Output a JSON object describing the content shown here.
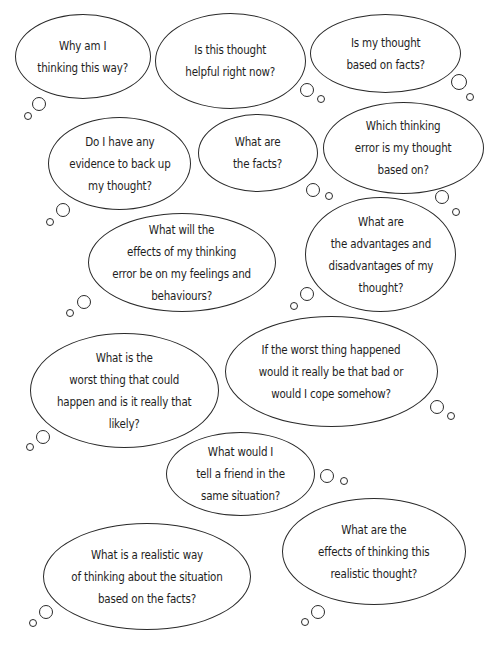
{
  "page": {
    "background": "#ffffff",
    "stroke_color": "#2a2a2a",
    "text_color": "#1e1e1e"
  },
  "bubbles": [
    {
      "id": "why-am-i-thinking",
      "lines": [
        "Why am I",
        "thinking this way?"
      ],
      "box": {
        "x": 15,
        "y": 14,
        "w": 136,
        "h": 85
      },
      "tails": [
        {
          "x": 39,
          "y": 104,
          "r": 7
        },
        {
          "x": 28,
          "y": 116,
          "r": 4
        }
      ]
    },
    {
      "id": "is-this-thought-helpful",
      "lines": [
        "Is this thought",
        "helpful right now?"
      ],
      "box": {
        "x": 155,
        "y": 13,
        "w": 151,
        "h": 96
      },
      "tails": [
        {
          "x": 307,
          "y": 90,
          "r": 7
        },
        {
          "x": 321,
          "y": 99,
          "r": 4
        }
      ]
    },
    {
      "id": "is-my-thought-based-on-facts",
      "lines": [
        "Is my thought",
        "based on facts?"
      ],
      "box": {
        "x": 310,
        "y": 14,
        "w": 151,
        "h": 79
      },
      "tails": [
        {
          "x": 459,
          "y": 82,
          "r": 8
        },
        {
          "x": 470,
          "y": 97,
          "r": 4
        }
      ]
    },
    {
      "id": "evidence-to-back-up",
      "lines": [
        "Do I have any",
        "evidence to back up",
        "my thought?"
      ],
      "box": {
        "x": 48,
        "y": 117,
        "w": 143,
        "h": 93
      },
      "tails": [
        {
          "x": 63,
          "y": 210,
          "r": 7
        },
        {
          "x": 50,
          "y": 222,
          "r": 4
        }
      ]
    },
    {
      "id": "what-are-the-facts",
      "lines": [
        "What are",
        "the facts?"
      ],
      "box": {
        "x": 198,
        "y": 114,
        "w": 120,
        "h": 78
      },
      "tails": [
        {
          "x": 313,
          "y": 190,
          "r": 7
        },
        {
          "x": 329,
          "y": 196,
          "r": 4
        }
      ]
    },
    {
      "id": "which-thinking-error",
      "lines": [
        "Which thinking",
        "error is my thought",
        "based on?"
      ],
      "box": {
        "x": 323,
        "y": 102,
        "w": 161,
        "h": 92
      },
      "tails": [
        {
          "x": 442,
          "y": 197,
          "r": 7
        },
        {
          "x": 456,
          "y": 212,
          "r": 4
        }
      ]
    },
    {
      "id": "effects-of-thinking-error",
      "lines": [
        "What will the",
        "effects of my thinking",
        "error be on my feelings and",
        "behaviours?"
      ],
      "box": {
        "x": 88,
        "y": 213,
        "w": 188,
        "h": 99
      },
      "tails": [
        {
          "x": 84,
          "y": 302,
          "r": 7
        },
        {
          "x": 70,
          "y": 313,
          "r": 4
        }
      ]
    },
    {
      "id": "advantages-and-disadvantages",
      "lines": [
        "What are",
        "the advantages and",
        "disadvantages of my",
        "thought?"
      ],
      "box": {
        "x": 305,
        "y": 197,
        "w": 151,
        "h": 115
      },
      "tails": [
        {
          "x": 307,
          "y": 294,
          "r": 7
        },
        {
          "x": 294,
          "y": 306,
          "r": 4
        }
      ]
    },
    {
      "id": "worst-thing-that-could-happen",
      "lines": [
        "What is the",
        "worst thing that could",
        "happen and is it really that",
        "likely?"
      ],
      "box": {
        "x": 30,
        "y": 333,
        "w": 189,
        "h": 115
      },
      "tails": [
        {
          "x": 43,
          "y": 437,
          "r": 7
        },
        {
          "x": 30,
          "y": 447,
          "r": 4
        }
      ]
    },
    {
      "id": "if-worst-thing-happened",
      "lines": [
        "If the worst thing happened",
        "would it really be that bad or",
        "would I cope somehow?"
      ],
      "box": {
        "x": 225,
        "y": 316,
        "w": 213,
        "h": 111
      },
      "tails": [
        {
          "x": 437,
          "y": 407,
          "r": 7
        },
        {
          "x": 451,
          "y": 416,
          "r": 4
        }
      ]
    },
    {
      "id": "tell-a-friend",
      "lines": [
        "What would I",
        "tell a friend in the",
        "same situation?"
      ],
      "box": {
        "x": 166,
        "y": 432,
        "w": 149,
        "h": 84
      },
      "tails": [
        {
          "x": 327,
          "y": 476,
          "r": 7
        },
        {
          "x": 344,
          "y": 481,
          "r": 4
        }
      ]
    },
    {
      "id": "realistic-way-of-thinking",
      "lines": [
        "What is a realistic way",
        "of thinking about the situation",
        "based on the facts?"
      ],
      "box": {
        "x": 43,
        "y": 523,
        "w": 208,
        "h": 107
      },
      "tails": [
        {
          "x": 46,
          "y": 612,
          "r": 7
        },
        {
          "x": 33,
          "y": 623,
          "r": 4
        }
      ]
    },
    {
      "id": "effects-of-realistic-thought",
      "lines": [
        "What are the",
        "effects of thinking this",
        "realistic thought?"
      ],
      "box": {
        "x": 282,
        "y": 498,
        "w": 184,
        "h": 107
      },
      "tails": [
        {
          "x": 318,
          "y": 612,
          "r": 7
        },
        {
          "x": 305,
          "y": 622,
          "r": 4
        }
      ]
    }
  ]
}
